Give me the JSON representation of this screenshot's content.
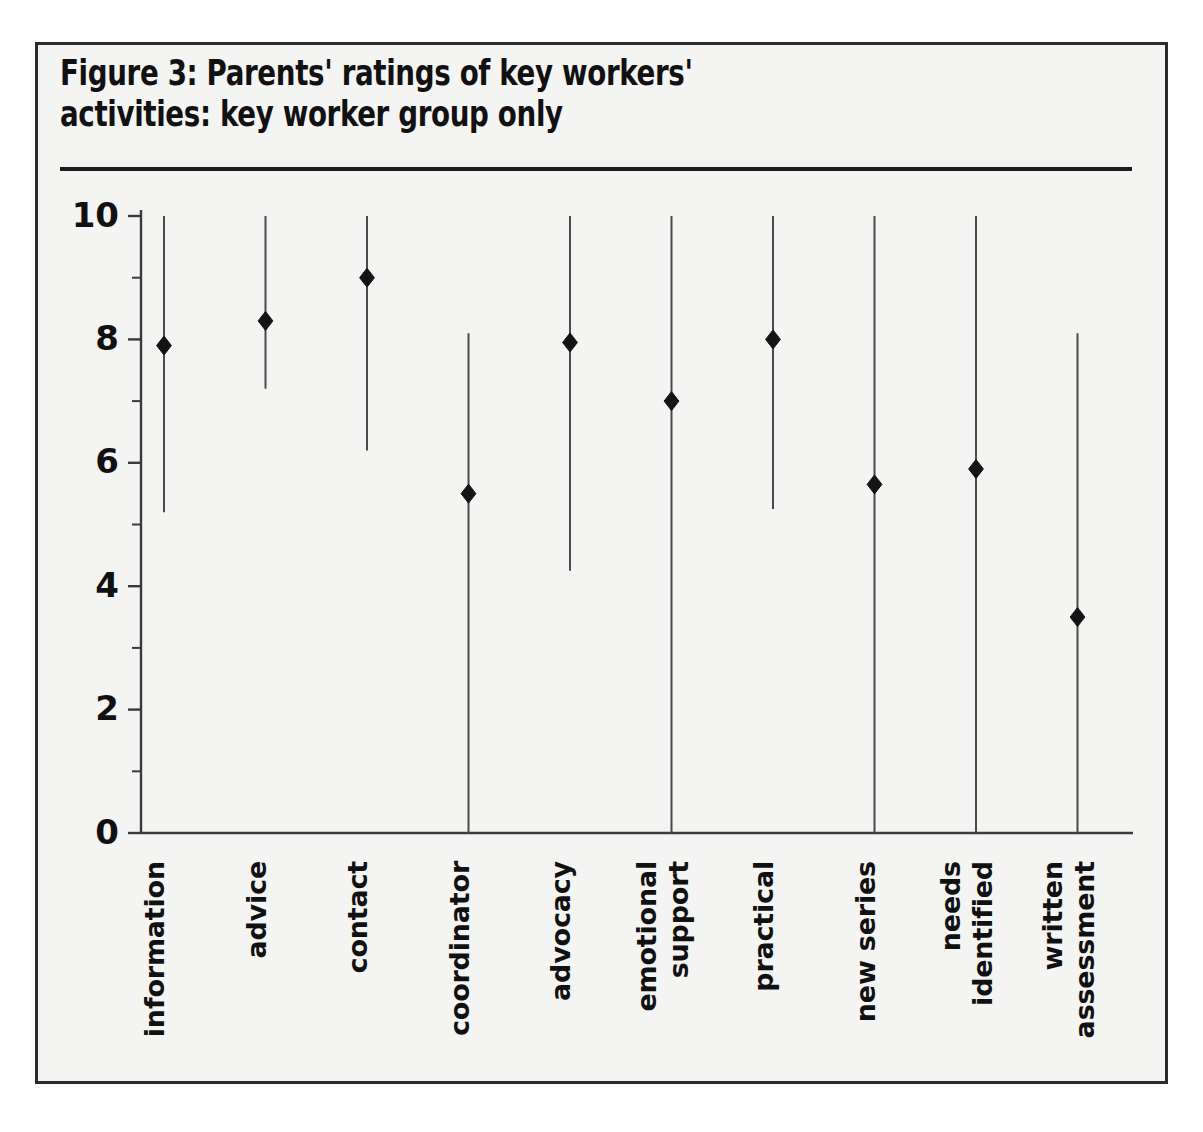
{
  "figure": {
    "title": "Figure 3: Parents' ratings of key workers'\nactivities: key worker group only",
    "border_color": "#2b2b2b",
    "panel_color": "#f4f4f3",
    "ink_color": "#141414"
  },
  "chart_data": {
    "type": "scatter",
    "title": "Figure 3: Parents' ratings of key workers' activities: key worker group only",
    "subtitle": "",
    "xlabel": "",
    "ylabel": "",
    "ylim": [
      0,
      10
    ],
    "yticks": [
      0,
      2,
      4,
      6,
      8,
      10
    ],
    "ytick_labels": [
      "0",
      "2",
      "4",
      "6",
      "8",
      "10"
    ],
    "minor_yticks": [
      1,
      3,
      5,
      7,
      9
    ],
    "grid": false,
    "legend": "none",
    "marker_style": "filled-diamond",
    "range_style": "vertical-line-min-to-max",
    "categories": [
      "information",
      "advice",
      "contact",
      "coordinator",
      "advocacy",
      "emotional support",
      "practical",
      "new series",
      "needs identified",
      "written assessment"
    ],
    "category_label_lines": [
      [
        "information"
      ],
      [
        "advice"
      ],
      [
        "contact"
      ],
      [
        "coordinator"
      ],
      [
        "advocacy"
      ],
      [
        "emotional",
        "support"
      ],
      [
        "practical"
      ],
      [
        "new series"
      ],
      [
        "needs",
        "identified"
      ],
      [
        "written",
        "assessment"
      ]
    ],
    "series": [
      {
        "name": "rating (median with range)",
        "points": [
          {
            "category": "information",
            "value": 7.9,
            "low": 5.2,
            "high": 10.0
          },
          {
            "category": "advice",
            "value": 8.3,
            "low": 7.2,
            "high": 10.0
          },
          {
            "category": "contact",
            "value": 9.0,
            "low": 6.2,
            "high": 10.0
          },
          {
            "category": "coordinator",
            "value": 5.5,
            "low": 0.0,
            "high": 8.1
          },
          {
            "category": "advocacy",
            "value": 7.95,
            "low": 4.25,
            "high": 10.0
          },
          {
            "category": "emotional support",
            "value": 7.0,
            "low": 0.0,
            "high": 10.0
          },
          {
            "category": "practical",
            "value": 8.0,
            "low": 5.25,
            "high": 10.0
          },
          {
            "category": "new series",
            "value": 5.65,
            "low": 0.0,
            "high": 10.0
          },
          {
            "category": "needs identified",
            "value": 5.9,
            "low": 0.0,
            "high": 10.0
          },
          {
            "category": "written assessment",
            "value": 3.5,
            "low": 0.0,
            "high": 8.1
          }
        ]
      }
    ],
    "values": [
      7.9,
      8.3,
      9.0,
      5.5,
      7.95,
      7.0,
      8.0,
      5.65,
      5.9,
      3.5
    ],
    "low": [
      5.2,
      7.2,
      6.2,
      0.0,
      4.25,
      0.0,
      5.25,
      0.0,
      0.0,
      0.0
    ],
    "high": [
      10.0,
      10.0,
      10.0,
      8.1,
      10.0,
      10.0,
      10.0,
      10.0,
      10.0,
      8.1
    ]
  }
}
